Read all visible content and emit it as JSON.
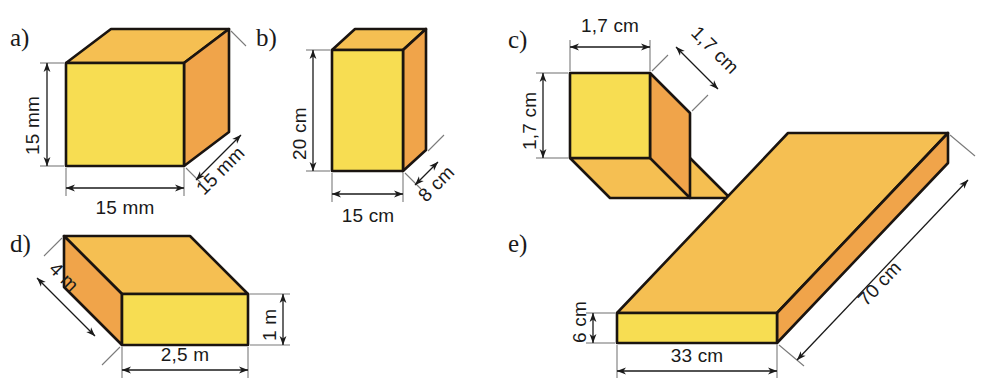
{
  "figure": {
    "colors": {
      "front_face": "#f7dd52",
      "top_face": "#f5bf52",
      "side_face": "#f0a44a",
      "outline": "#1a1410",
      "extension_line": "#7a7a7a",
      "dimension_line": "#1a1a1a",
      "background": "#ffffff"
    }
  },
  "shapes": [
    {
      "id": "a",
      "letter": "a)",
      "kind": "cube",
      "dimensions": {
        "height": "15 mm",
        "width": "15 mm",
        "depth": "15 mm"
      }
    },
    {
      "id": "b",
      "letter": "b)",
      "kind": "cuboid",
      "dimensions": {
        "height": "20 cm",
        "width": "15 cm",
        "depth": "8 cm"
      }
    },
    {
      "id": "c",
      "letter": "c)",
      "kind": "cube",
      "dimensions": {
        "height": "1,7 cm",
        "width": "1,7 cm",
        "depth": "1,7 cm"
      }
    },
    {
      "id": "d",
      "letter": "d)",
      "kind": "cuboid",
      "dimensions": {
        "height": "1 m",
        "width": "2,5 m",
        "depth": "4 m"
      }
    },
    {
      "id": "e",
      "letter": "e)",
      "kind": "slab",
      "dimensions": {
        "height": "6 cm",
        "width": "33 cm",
        "depth": "70 cm"
      }
    }
  ]
}
